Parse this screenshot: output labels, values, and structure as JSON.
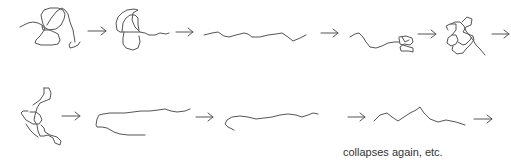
{
  "diagram": {
    "type": "process-sequence",
    "rows": [
      {
        "states": [
          "tangled-coil",
          "compact-globule",
          "extended-chain",
          "partially-collapsed-chain",
          "tangled-coil"
        ],
        "ends_with_arrow": true
      },
      {
        "states": [
          "elongated-loop",
          "extended-chain",
          "extended-chain",
          "zigzag-chain"
        ],
        "ends_with_arrow": true
      }
    ],
    "caption": "collapses again, etc.",
    "stroke_color": "#555555",
    "arrow_icon": "right-arrow"
  }
}
